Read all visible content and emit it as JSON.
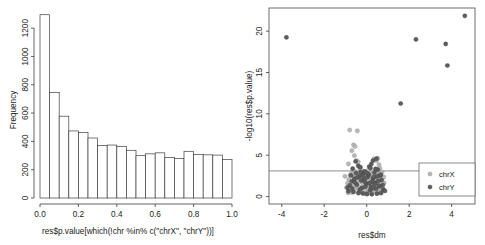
{
  "figure": {
    "panels": [
      "histogram",
      "volcano"
    ]
  },
  "chart_data": [
    {
      "type": "bar",
      "title": "",
      "subtitle": "",
      "panel": "histogram",
      "xlabel": "res$p.value[which(!chr %in% c(\"chrX\", \"chrY\"))]",
      "ylabel": "Frequency",
      "xlim": [
        0.0,
        1.0
      ],
      "ylim": [
        0,
        1300
      ],
      "grid": false,
      "legend": "none",
      "xticks": [
        0.0,
        0.2,
        0.4,
        0.6,
        0.8,
        1.0
      ],
      "xticklabels": [
        "0.0",
        "0.2",
        "0.4",
        "0.6",
        "0.8",
        "1.0"
      ],
      "yticks": [
        0,
        200,
        400,
        600,
        800,
        1000,
        1200
      ],
      "yticklabels": [
        "0",
        "200",
        "400",
        "600",
        "800",
        "1000",
        "1200"
      ],
      "bin_width": 0.05,
      "bin_edges": [
        0.0,
        0.05,
        0.1,
        0.15,
        0.2,
        0.25,
        0.3,
        0.35,
        0.4,
        0.45,
        0.5,
        0.55,
        0.6,
        0.65,
        0.7,
        0.75,
        0.8,
        0.85,
        0.9,
        0.95,
        1.0
      ],
      "categories": [
        "0.00-0.05",
        "0.05-0.10",
        "0.10-0.15",
        "0.15-0.20",
        "0.20-0.25",
        "0.25-0.30",
        "0.30-0.35",
        "0.35-0.40",
        "0.40-0.45",
        "0.45-0.50",
        "0.50-0.55",
        "0.55-0.60",
        "0.60-0.65",
        "0.65-0.70",
        "0.70-0.75",
        "0.75-0.80",
        "0.80-0.85",
        "0.85-0.90",
        "0.90-0.95",
        "0.95-1.00"
      ],
      "values": [
        1295,
        745,
        578,
        474,
        462,
        424,
        370,
        374,
        365,
        337,
        299,
        312,
        319,
        287,
        280,
        330,
        307,
        305,
        303,
        272
      ]
    },
    {
      "type": "scatter",
      "title": "",
      "panel": "volcano",
      "xlabel": "res$dm",
      "ylabel": "-log10(res$p.value)",
      "xlim": [
        -4.6,
        5.1
      ],
      "ylim": [
        -0.9,
        22.8
      ],
      "grid": false,
      "legend": "bottom-right",
      "xticks": [
        -4,
        -2,
        0,
        2,
        4
      ],
      "xticklabels": [
        "-4",
        "-2",
        "0",
        "2",
        "4"
      ],
      "yticks": [
        0,
        5,
        10,
        15,
        20
      ],
      "yticklabels": [
        "0",
        "5",
        "10",
        "15",
        "20"
      ],
      "hline_y": 3.1,
      "series": [
        {
          "name": "chrX",
          "marker": "open-circle",
          "color": "#b9b9b9",
          "points": [
            [
              -1.02,
              2.45
            ],
            [
              -0.86,
              3.95
            ],
            [
              -0.8,
              8.05
            ],
            [
              -0.7,
              5.55
            ],
            [
              -0.62,
              6.25
            ],
            [
              -0.58,
              4.95
            ],
            [
              -0.55,
              6.05
            ],
            [
              -0.48,
              4.35
            ],
            [
              -0.44,
              7.95
            ],
            [
              -0.4,
              4.2
            ],
            [
              -0.34,
              3.55
            ],
            [
              -0.3,
              3.3
            ],
            [
              0.34,
              4.55
            ],
            [
              0.46,
              4.35
            ],
            [
              0.52,
              4.62
            ],
            [
              0.58,
              3.85
            ],
            [
              0.62,
              3.42
            ],
            [
              -0.95,
              1.1
            ],
            [
              -0.9,
              1.6
            ],
            [
              -0.84,
              2.05
            ],
            [
              -0.78,
              2.6
            ],
            [
              -0.74,
              1.35
            ],
            [
              -0.7,
              2.9
            ],
            [
              -0.66,
              0.75
            ],
            [
              -0.62,
              1.95
            ],
            [
              -0.58,
              2.35
            ],
            [
              -0.54,
              1.25
            ],
            [
              -0.5,
              2.7
            ],
            [
              -0.46,
              0.95
            ],
            [
              -0.42,
              1.8
            ],
            [
              -0.38,
              2.45
            ],
            [
              -0.34,
              1.15
            ],
            [
              -0.3,
              2.2
            ],
            [
              -0.26,
              0.65
            ],
            [
              -0.22,
              1.7
            ],
            [
              -0.18,
              2.55
            ],
            [
              -0.14,
              1.05
            ],
            [
              -0.1,
              2.1
            ],
            [
              -0.06,
              0.55
            ],
            [
              -0.02,
              1.45
            ],
            [
              0.02,
              2.3
            ],
            [
              0.06,
              0.85
            ],
            [
              0.1,
              1.9
            ],
            [
              0.14,
              2.65
            ],
            [
              0.18,
              1.2
            ],
            [
              0.22,
              2.15
            ],
            [
              0.26,
              0.7
            ],
            [
              0.3,
              1.75
            ],
            [
              0.34,
              2.5
            ],
            [
              0.38,
              1.0
            ],
            [
              0.42,
              2.05
            ],
            [
              0.46,
              0.6
            ],
            [
              0.5,
              1.55
            ],
            [
              0.54,
              2.4
            ],
            [
              0.58,
              0.9
            ],
            [
              0.62,
              1.85
            ],
            [
              0.66,
              2.6
            ],
            [
              0.7,
              1.3
            ],
            [
              0.74,
              2.25
            ],
            [
              0.78,
              0.8
            ],
            [
              0.82,
              1.65
            ],
            [
              -0.88,
              0.45
            ],
            [
              -0.72,
              0.5
            ],
            [
              -0.56,
              3.05
            ],
            [
              -0.4,
              0.4
            ],
            [
              -0.24,
              3.15
            ],
            [
              -0.08,
              0.35
            ],
            [
              0.08,
              3.2
            ],
            [
              0.24,
              0.42
            ],
            [
              0.4,
              3.1
            ],
            [
              0.56,
              0.48
            ],
            [
              0.72,
              2.95
            ],
            [
              -0.64,
              2.78
            ],
            [
              -0.48,
              1.42
            ],
            [
              -0.32,
              2.88
            ],
            [
              -0.16,
              1.58
            ],
            [
              0.0,
              0.3
            ],
            [
              0.16,
              2.82
            ],
            [
              0.32,
              1.38
            ],
            [
              0.48,
              2.92
            ],
            [
              0.64,
              0.52
            ],
            [
              0.8,
              2.35
            ]
          ]
        },
        {
          "name": "chrY",
          "marker": "filled-circle",
          "color": "#5e5e5e",
          "points": [
            [
              -3.78,
              19.25
            ],
            [
              4.62,
              21.85
            ],
            [
              2.32,
              19.0
            ],
            [
              3.72,
              18.45
            ],
            [
              3.8,
              15.85
            ],
            [
              1.6,
              11.25
            ],
            [
              0.3,
              4.35
            ],
            [
              0.46,
              4.58
            ],
            [
              -0.52,
              4.25
            ],
            [
              -0.4,
              3.72
            ],
            [
              0.12,
              3.62
            ],
            [
              0.22,
              3.95
            ],
            [
              -0.1,
              3.05
            ],
            [
              0.04,
              2.35
            ],
            [
              -0.2,
              2.7
            ],
            [
              0.36,
              2.9
            ],
            [
              0.52,
              3.25
            ],
            [
              0.64,
              2.55
            ],
            [
              -0.7,
              1.85
            ],
            [
              -0.58,
              2.15
            ],
            [
              -0.46,
              1.45
            ],
            [
              -0.34,
              2.45
            ],
            [
              -0.22,
              1.05
            ],
            [
              -0.12,
              2.05
            ],
            [
              0.0,
              1.55
            ],
            [
              0.1,
              2.6
            ],
            [
              0.2,
              1.15
            ],
            [
              0.3,
              2.2
            ],
            [
              0.4,
              1.65
            ],
            [
              0.5,
              2.45
            ],
            [
              0.6,
              1.25
            ],
            [
              0.7,
              2.0
            ],
            [
              -0.8,
              1.35
            ],
            [
              -0.68,
              0.95
            ],
            [
              -0.56,
              1.7
            ],
            [
              -0.44,
              2.3
            ],
            [
              -0.32,
              0.85
            ],
            [
              -0.26,
              1.95
            ],
            [
              -0.16,
              2.5
            ],
            [
              -0.06,
              1.2
            ],
            [
              0.06,
              2.75
            ],
            [
              0.16,
              0.75
            ],
            [
              0.26,
              1.8
            ],
            [
              0.34,
              2.35
            ],
            [
              0.44,
              0.95
            ],
            [
              0.54,
              1.9
            ],
            [
              0.66,
              2.65
            ],
            [
              0.76,
              1.4
            ],
            [
              -0.86,
              0.65
            ],
            [
              -0.74,
              2.55
            ],
            [
              -0.62,
              0.55
            ],
            [
              -0.5,
              2.85
            ],
            [
              -0.38,
              0.45
            ],
            [
              -0.28,
              2.95
            ],
            [
              -0.18,
              0.38
            ],
            [
              -0.08,
              1.75
            ],
            [
              0.02,
              0.32
            ],
            [
              0.14,
              1.62
            ],
            [
              0.24,
              0.28
            ],
            [
              0.38,
              1.48
            ],
            [
              0.48,
              0.35
            ],
            [
              0.58,
              1.32
            ],
            [
              0.68,
              0.42
            ],
            [
              0.78,
              0.88
            ],
            [
              -0.9,
              1.05
            ],
            [
              0.86,
              0.68
            ],
            [
              -0.66,
              3.38
            ],
            [
              0.18,
              3.45
            ],
            [
              -0.3,
              3.55
            ],
            [
              0.42,
              3.35
            ],
            [
              -0.02,
              2.88
            ],
            [
              0.28,
              1.02
            ]
          ]
        }
      ]
    }
  ],
  "histogram": {
    "xlabel": "res$p.value[which(!chr %in% c(\"chrX\", \"chrY\"))]",
    "ylabel": "Frequency"
  },
  "volcano": {
    "xlabel": "res$dm",
    "ylabel": "-log10(res$p.value)",
    "legend": {
      "items": [
        {
          "label": "chrX"
        },
        {
          "label": "chrY"
        }
      ]
    }
  }
}
